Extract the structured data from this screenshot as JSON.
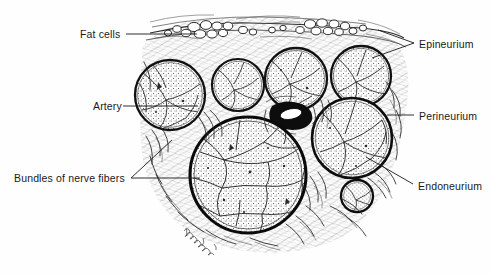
{
  "figure": {
    "style": "black and white stippled pen-and-ink anatomical drawing",
    "background_color": "#ffffff",
    "ink_color": "#1a1a1a",
    "signature": "artist signature, lower left of specimen"
  },
  "labels": {
    "fat_cells": "Fat cells",
    "artery": "Artery",
    "bundles": "Bundles of nerve fibers",
    "epineurium": "Epineurium",
    "perineurium": "Perineurium",
    "endoneurium": "Endoneurium"
  },
  "structures": {
    "fascicles": [
      {
        "name": "fascicle-upper-left",
        "cx": 170,
        "cy": 95,
        "r": 36
      },
      {
        "name": "fascicle-upper-mid",
        "cx": 238,
        "cy": 85,
        "r": 27
      },
      {
        "name": "fascicle-upper-center",
        "cx": 296,
        "cy": 79,
        "r": 32
      },
      {
        "name": "fascicle-upper-right",
        "cx": 361,
        "cy": 76,
        "r": 31
      },
      {
        "name": "fascicle-large-central",
        "cx": 248,
        "cy": 175,
        "r": 59
      },
      {
        "name": "fascicle-right-lower",
        "cx": 352,
        "cy": 138,
        "r": 41
      },
      {
        "name": "fascicle-small",
        "cx": 357,
        "cy": 196,
        "r": 17
      }
    ],
    "blood_vessel": {
      "name": "artery-lumen",
      "cx": 292,
      "cy": 114,
      "rx": 14,
      "ry": 7
    },
    "fat_cell_cluster": {
      "name": "fat-cells-band",
      "x": 180,
      "y": 18,
      "width": 190,
      "height": 18
    }
  },
  "leaders": {
    "fat_cells": [
      [
        126,
        34
      ],
      [
        196,
        34
      ]
    ],
    "artery": [
      [
        122,
        106
      ],
      [
        196,
        106
      ]
    ],
    "bundles": [
      [
        131,
        178
      ],
      [
        199,
        178
      ],
      [
        169,
        142
      ]
    ],
    "epineurium": [
      [
        414,
        43
      ],
      [
        380,
        33
      ],
      [
        414,
        43
      ],
      [
        372,
        57
      ]
    ],
    "perineurium": [
      [
        414,
        115
      ],
      [
        386,
        115
      ]
    ],
    "endoneurium": [
      [
        414,
        185
      ],
      [
        366,
        158
      ]
    ]
  }
}
